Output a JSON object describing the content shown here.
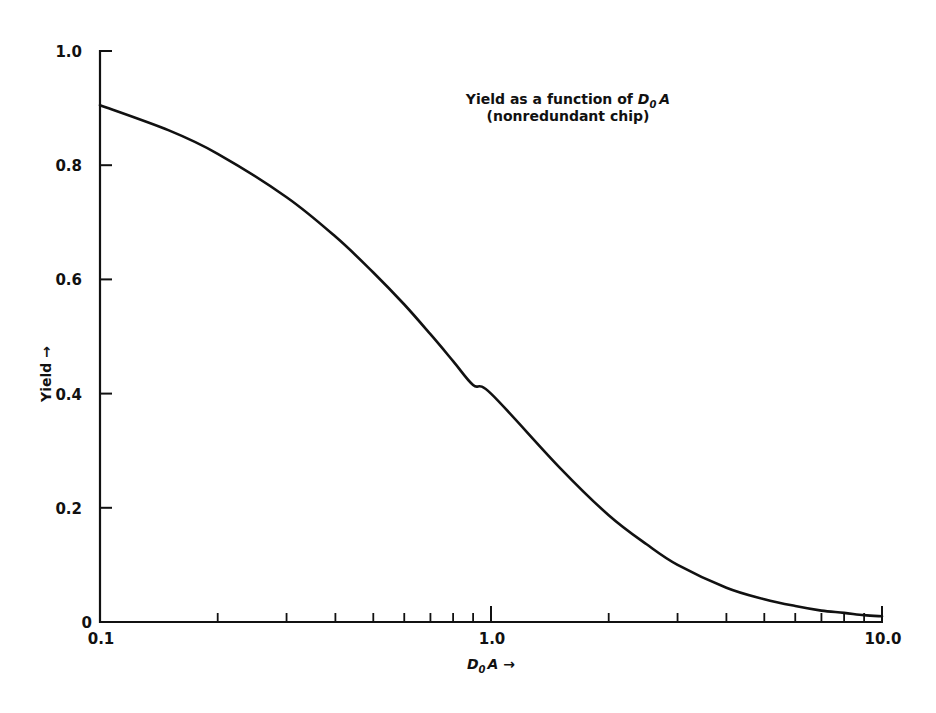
{
  "chart_data": {
    "type": "line",
    "title": "Yield as a function of D0A",
    "title_parts": {
      "prefix": "Yield as a function of ",
      "var_main": "D",
      "var_sub": "0",
      "var_tail": "A"
    },
    "subtitle": "(nonredundant chip)",
    "xlabel": "D0A →",
    "xlabel_parts": {
      "main": "D",
      "sub": "0",
      "tail": "A",
      "arrow": "→"
    },
    "ylabel": "Yield →",
    "xscale": "log",
    "xlim": [
      0.1,
      10.0
    ],
    "ylim": [
      0,
      1.0
    ],
    "grid": false,
    "legend": null,
    "x_tick_labels": [
      "0.1",
      "1.0",
      "10.0"
    ],
    "x_tick_values": [
      0.1,
      1.0,
      10.0
    ],
    "x_minor_ticks": [
      0.2,
      0.3,
      0.4,
      0.5,
      0.6,
      0.7,
      0.8,
      0.9,
      2,
      3,
      4,
      5,
      6,
      7,
      8,
      9
    ],
    "y_tick_labels": [
      "0",
      "0.2",
      "0.4",
      "0.6",
      "0.8",
      "1.0"
    ],
    "y_tick_values": [
      0,
      0.2,
      0.4,
      0.6,
      0.8,
      1.0
    ],
    "series": [
      {
        "name": "Yield (nonredundant chip)",
        "color": "#111111",
        "x": [
          0.1,
          0.15,
          0.2,
          0.3,
          0.4,
          0.5,
          0.6,
          0.7,
          0.8,
          0.9,
          1.0,
          1.5,
          2.0,
          2.5,
          3.0,
          4.0,
          5.0,
          6.0,
          7.0,
          8.0,
          9.0,
          10.0
        ],
        "values": [
          0.905,
          0.861,
          0.82,
          0.744,
          0.675,
          0.612,
          0.556,
          0.504,
          0.457,
          0.415,
          0.4,
          0.27,
          0.187,
          0.136,
          0.1,
          0.06,
          0.04,
          0.028,
          0.02,
          0.016,
          0.012,
          0.01
        ]
      }
    ]
  }
}
